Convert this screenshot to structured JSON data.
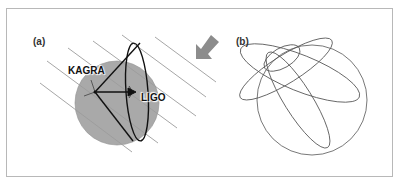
{
  "figure": {
    "panel_a": {
      "label": "(a)",
      "detectors": [
        {
          "name": "KAGRA"
        },
        {
          "name": "LIGO"
        }
      ],
      "earth_color": "#a9a9a9",
      "wave_line_color": "#9a9a9a",
      "arrow_color": "#8c8c8c"
    },
    "panel_b": {
      "label": "(b)"
    }
  }
}
